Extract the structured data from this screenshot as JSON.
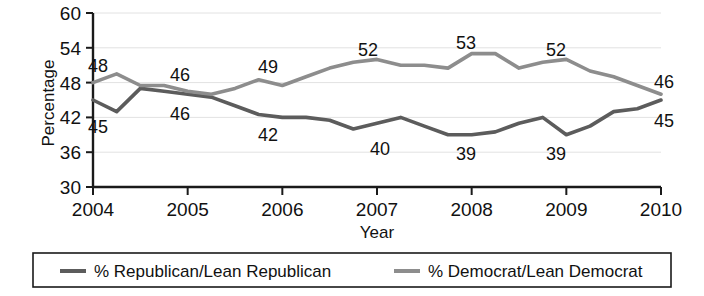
{
  "chart_data": {
    "type": "line",
    "title": "",
    "xlabel": "Year",
    "ylabel": "Percentage",
    "ylim": [
      30,
      60
    ],
    "xlim": [
      2004,
      2010
    ],
    "grid": true,
    "legend_position": "bottom",
    "y_ticks": [
      "30",
      "36",
      "42",
      "48",
      "54",
      "60"
    ],
    "y_tick_values": [
      30,
      36,
      42,
      48,
      54,
      60
    ],
    "x_ticks": [
      "2004",
      "2005",
      "2006",
      "2007",
      "2008",
      "2009",
      "2010"
    ],
    "x_tick_values": [
      2004,
      2005,
      2006,
      2007,
      2008,
      2009,
      2010
    ],
    "x": [
      2004.0,
      2004.25,
      2004.5,
      2004.75,
      2005.0,
      2005.25,
      2005.5,
      2005.75,
      2006.0,
      2006.25,
      2006.5,
      2006.75,
      2007.0,
      2007.25,
      2007.5,
      2007.75,
      2008.0,
      2008.25,
      2008.5,
      2008.75,
      2009.0,
      2009.25,
      2009.5,
      2009.75,
      2010.0
    ],
    "series": [
      {
        "name": "% Republican/Lean Republican",
        "color": "#5c5c5c",
        "values": [
          45,
          43,
          47,
          46.5,
          46,
          45.5,
          44,
          42.5,
          42,
          42,
          41.5,
          40,
          41,
          42,
          40.5,
          39,
          39,
          39.5,
          41,
          42,
          39,
          40.5,
          43,
          43.5,
          45
        ]
      },
      {
        "name": "% Democrat/Lean Democrat",
        "color": "#8d8d8d",
        "values": [
          48,
          49.5,
          47.5,
          47.5,
          46.5,
          46,
          47,
          48.5,
          47.5,
          49,
          50.5,
          51.5,
          52,
          51,
          51,
          50.5,
          53,
          53,
          50.5,
          51.5,
          52,
          50,
          49,
          47.5,
          46
        ]
      }
    ],
    "point_labels": [
      {
        "text": "48",
        "series": "% Democrat/Lean Democrat",
        "x": 98,
        "y": 72
      },
      {
        "text": "45",
        "series": "% Republican/Lean Republican",
        "x": 98,
        "y": 133
      },
      {
        "text": "46",
        "series": "% Democrat/Lean Democrat",
        "x": 180,
        "y": 81
      },
      {
        "text": "46",
        "series": "% Republican/Lean Republican",
        "x": 180,
        "y": 120
      },
      {
        "text": "49",
        "series": "% Democrat/Lean Democrat",
        "x": 268,
        "y": 73
      },
      {
        "text": "42",
        "series": "% Republican/Lean Republican",
        "x": 268,
        "y": 141
      },
      {
        "text": "52",
        "series": "% Democrat/Lean Democrat",
        "x": 368,
        "y": 56
      },
      {
        "text": "40",
        "series": "% Republican/Lean Republican",
        "x": 380,
        "y": 155
      },
      {
        "text": "53",
        "series": "% Democrat/Lean Democrat",
        "x": 466,
        "y": 49
      },
      {
        "text": "39",
        "series": "% Republican/Lean Republican",
        "x": 466,
        "y": 160
      },
      {
        "text": "52",
        "series": "% Democrat/Lean Democrat",
        "x": 556,
        "y": 56
      },
      {
        "text": "39",
        "series": "% Republican/Lean Republican",
        "x": 556,
        "y": 160
      },
      {
        "text": "46",
        "series": "% Democrat/Lean Democrat",
        "x": 664,
        "y": 88
      },
      {
        "text": "45",
        "series": "% Republican/Lean Republican",
        "x": 664,
        "y": 127
      }
    ]
  },
  "legend": {
    "items": [
      {
        "label": "% Republican/Lean Republican",
        "color": "#5c5c5c"
      },
      {
        "label": "% Democrat/Lean Democrat",
        "color": "#8d8d8d"
      }
    ]
  }
}
